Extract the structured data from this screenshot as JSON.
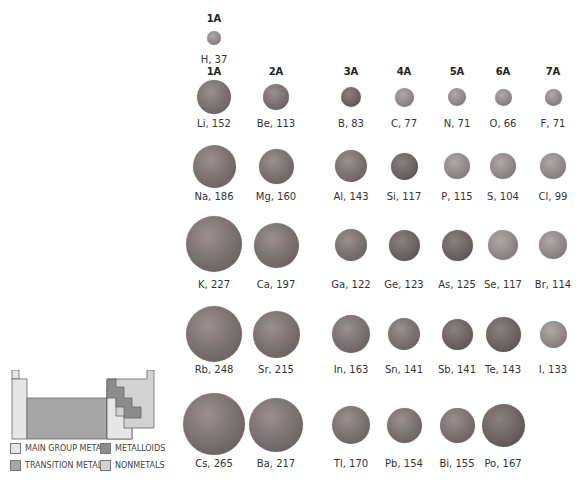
{
  "colors": {
    "main_group_metals": "#e6e6e6",
    "transition_metals": "#a6a6a6",
    "metalloids": "#8c8c8c",
    "nonmetals": "#d2d2d2"
  },
  "headers": [
    {
      "label": "1A",
      "x": 214,
      "y": 13
    },
    {
      "label": "1A",
      "x": 214,
      "y": 66
    },
    {
      "label": "2A",
      "x": 276,
      "y": 66
    },
    {
      "label": "3A",
      "x": 351,
      "y": 66
    },
    {
      "label": "4A",
      "x": 404,
      "y": 66
    },
    {
      "label": "5A",
      "x": 457,
      "y": 66
    },
    {
      "label": "6A",
      "x": 503,
      "y": 66
    },
    {
      "label": "7A",
      "x": 553,
      "y": 66
    }
  ],
  "atoms": [
    {
      "symbol": "H",
      "radius_pm": 37,
      "label": "H, 37",
      "x": 214,
      "y": 38,
      "d": 14,
      "ly": 54,
      "type": "nonmetal"
    },
    {
      "symbol": "Li",
      "radius_pm": 152,
      "label": "Li, 152",
      "x": 214,
      "y": 97,
      "d": 34,
      "ly": 118,
      "type": "metal"
    },
    {
      "symbol": "Be",
      "radius_pm": 113,
      "label": "Be, 113",
      "x": 276,
      "y": 97,
      "d": 26,
      "ly": 118,
      "type": "metal"
    },
    {
      "symbol": "B",
      "radius_pm": 83,
      "label": "B, 83",
      "x": 351,
      "y": 97,
      "d": 20,
      "ly": 118,
      "type": "metalloid"
    },
    {
      "symbol": "C",
      "radius_pm": 77,
      "label": "C, 77",
      "x": 404,
      "y": 97,
      "d": 19,
      "ly": 118,
      "type": "nonmetal"
    },
    {
      "symbol": "N",
      "radius_pm": 71,
      "label": "N, 71",
      "x": 457,
      "y": 97,
      "d": 18,
      "ly": 118,
      "type": "nonmetal"
    },
    {
      "symbol": "O",
      "radius_pm": 66,
      "label": "O, 66",
      "x": 503,
      "y": 97,
      "d": 17,
      "ly": 118,
      "type": "nonmetal"
    },
    {
      "symbol": "F",
      "radius_pm": 71,
      "label": "F, 71",
      "x": 553,
      "y": 97,
      "d": 17,
      "ly": 118,
      "type": "nonmetal"
    },
    {
      "symbol": "Na",
      "radius_pm": 186,
      "label": "Na, 186",
      "x": 214,
      "y": 166,
      "d": 43,
      "ly": 191,
      "type": "metal"
    },
    {
      "symbol": "Mg",
      "radius_pm": 160,
      "label": "Mg, 160",
      "x": 276,
      "y": 166,
      "d": 35,
      "ly": 191,
      "type": "metal"
    },
    {
      "symbol": "Al",
      "radius_pm": 143,
      "label": "Al, 143",
      "x": 351,
      "y": 166,
      "d": 32,
      "ly": 191,
      "type": "metal"
    },
    {
      "symbol": "Si",
      "radius_pm": 117,
      "label": "Si, 117",
      "x": 404,
      "y": 166,
      "d": 27,
      "ly": 191,
      "type": "metalloid"
    },
    {
      "symbol": "P",
      "radius_pm": 115,
      "label": "P, 115",
      "x": 457,
      "y": 166,
      "d": 26,
      "ly": 191,
      "type": "nonmetal"
    },
    {
      "symbol": "S",
      "radius_pm": 104,
      "label": "S, 104",
      "x": 503,
      "y": 166,
      "d": 26,
      "ly": 191,
      "type": "nonmetal"
    },
    {
      "symbol": "Cl",
      "radius_pm": 99,
      "label": "Cl, 99",
      "x": 553,
      "y": 166,
      "d": 26,
      "ly": 191,
      "type": "nonmetal"
    },
    {
      "symbol": "K",
      "radius_pm": 227,
      "label": "K, 227",
      "x": 214,
      "y": 244,
      "d": 56,
      "ly": 279,
      "type": "metal"
    },
    {
      "symbol": "Ca",
      "radius_pm": 197,
      "label": "Ca, 197",
      "x": 276,
      "y": 245,
      "d": 45,
      "ly": 279,
      "type": "metal"
    },
    {
      "symbol": "Ga",
      "radius_pm": 122,
      "label": "Ga, 122",
      "x": 351,
      "y": 245,
      "d": 32,
      "ly": 279,
      "type": "metal"
    },
    {
      "symbol": "Ge",
      "radius_pm": 123,
      "label": "Ge, 123",
      "x": 404,
      "y": 245,
      "d": 31,
      "ly": 279,
      "type": "metalloid"
    },
    {
      "symbol": "As",
      "radius_pm": 125,
      "label": "As, 125",
      "x": 457,
      "y": 245,
      "d": 31,
      "ly": 279,
      "type": "metalloid"
    },
    {
      "symbol": "Se",
      "radius_pm": 117,
      "label": "Se, 117",
      "x": 503,
      "y": 245,
      "d": 30,
      "ly": 279,
      "type": "nonmetal"
    },
    {
      "symbol": "Br",
      "radius_pm": 114,
      "label": "Br, 114",
      "x": 553,
      "y": 245,
      "d": 28,
      "ly": 279,
      "type": "nonmetal"
    },
    {
      "symbol": "Rb",
      "radius_pm": 248,
      "label": "Rb, 248",
      "x": 214,
      "y": 334,
      "d": 56,
      "ly": 364,
      "type": "metal"
    },
    {
      "symbol": "Sr",
      "radius_pm": 215,
      "label": "Sr, 215",
      "x": 276,
      "y": 334,
      "d": 47,
      "ly": 364,
      "type": "metal"
    },
    {
      "symbol": "In",
      "radius_pm": 163,
      "label": "In, 163",
      "x": 351,
      "y": 334,
      "d": 38,
      "ly": 364,
      "type": "metal"
    },
    {
      "symbol": "Sn",
      "radius_pm": 141,
      "label": "Sn, 141",
      "x": 404,
      "y": 334,
      "d": 32,
      "ly": 364,
      "type": "metal"
    },
    {
      "symbol": "Sb",
      "radius_pm": 141,
      "label": "Sb, 141",
      "x": 457,
      "y": 334,
      "d": 31,
      "ly": 364,
      "type": "metalloid"
    },
    {
      "symbol": "Te",
      "radius_pm": 143,
      "label": "Te, 143",
      "x": 503,
      "y": 334,
      "d": 35,
      "ly": 364,
      "type": "metalloid"
    },
    {
      "symbol": "I",
      "radius_pm": 133,
      "label": "I, 133",
      "x": 553,
      "y": 334,
      "d": 27,
      "ly": 364,
      "type": "nonmetal"
    },
    {
      "symbol": "Cs",
      "radius_pm": 265,
      "label": "Cs, 265",
      "x": 214,
      "y": 424,
      "d": 62,
      "ly": 458,
      "type": "metal"
    },
    {
      "symbol": "Ba",
      "radius_pm": 217,
      "label": "Ba, 217",
      "x": 276,
      "y": 425,
      "d": 54,
      "ly": 458,
      "type": "metal"
    },
    {
      "symbol": "Tl",
      "radius_pm": 170,
      "label": "Tl, 170",
      "x": 351,
      "y": 425,
      "d": 38,
      "ly": 458,
      "type": "metal"
    },
    {
      "symbol": "Pb",
      "radius_pm": 154,
      "label": "Pb, 154",
      "x": 404,
      "y": 425,
      "d": 35,
      "ly": 458,
      "type": "metal"
    },
    {
      "symbol": "Bi",
      "radius_pm": 155,
      "label": "Bi, 155",
      "x": 457,
      "y": 425,
      "d": 35,
      "ly": 458,
      "type": "metal"
    },
    {
      "symbol": "Po",
      "radius_pm": 167,
      "label": "Po, 167",
      "x": 503,
      "y": 425,
      "d": 43,
      "ly": 458,
      "type": "metalloid"
    }
  ],
  "legend": [
    {
      "label": "MAIN GROUP METALS",
      "color_key": "main_group_metals",
      "x": 0,
      "y": 0
    },
    {
      "label": "METALLOIDS",
      "color_key": "metalloids",
      "x": 90,
      "y": 0
    },
    {
      "label": "TRANSITION METALS",
      "color_key": "transition_metals",
      "x": 0,
      "y": 17
    },
    {
      "label": "NONMETALS",
      "color_key": "nonmetals",
      "x": 90,
      "y": 17
    }
  ]
}
